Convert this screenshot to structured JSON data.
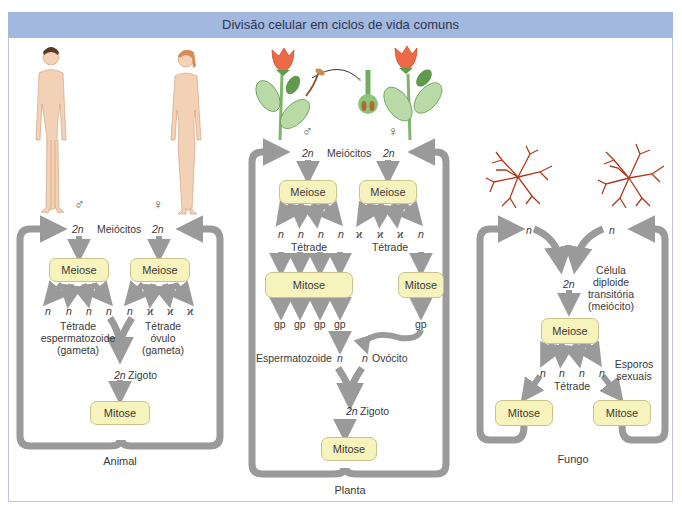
{
  "title": "Divisão celular em ciclos de vida comuns",
  "colors": {
    "title_bar": "#a3b8df",
    "box_fill": "#f7f3bd",
    "arrow": "#9a9a9a",
    "fungus": "#b03a1e",
    "flower": "#e8603c",
    "leaf": "#a9cf9a"
  },
  "animal": {
    "caption": "Animal",
    "male_symbol": "♂",
    "female_symbol": "♀",
    "meiocytes_label": "Meiócitos",
    "ploidy_2n": "2n",
    "meiose_label": "Meiose",
    "haploid": "n",
    "polar": "ϰ",
    "male_tetrad": "Tétrade\nespermatozoide\n(gameta)",
    "male_tetrad_l1": "Tétrade",
    "male_tetrad_l2": "espermatozoide",
    "male_tetrad_l3": "(gameta)",
    "female_tetrad_l1": "Tétrade",
    "female_tetrad_l2": "óvulo",
    "female_tetrad_l3": "(gameta)",
    "zygote_label": "Zigoto",
    "mitose_label": "Mitose",
    "icons": [
      "male-human-figure",
      "female-human-figure"
    ]
  },
  "plant": {
    "caption": "Planta",
    "male_symbol": "♂",
    "female_symbol": "♀",
    "meiocytes_label": "Meiócitos",
    "ploidy_2n": "2n",
    "meiose_label": "Meiose",
    "haploid": "n",
    "polar": "ϰ",
    "tetrad_label": "Tétrade",
    "mitose_label": "Mitose",
    "gp": "gp",
    "sperm_label": "Espermatozoide",
    "egg_label": "Ovócito",
    "zygote_label": "Zigoto",
    "icons": [
      "flower-male",
      "pollen-grain",
      "pistil-ovary",
      "flower-female"
    ]
  },
  "fungus": {
    "caption": "Fungo",
    "haploid": "n",
    "ploidy_2n": "2n",
    "diploid_l1": "Célula",
    "diploid_l2": "diploide",
    "diploid_l3": "transitória",
    "diploid_l4": "(meiócito)",
    "meiose_label": "Meiose",
    "tetrad_label": "Tétrade",
    "spores_l1": "Esporos",
    "spores_l2": "sexuais",
    "mitose_label": "Mitose",
    "icons": [
      "fungal-mycelium-left",
      "fungal-mycelium-right"
    ]
  }
}
